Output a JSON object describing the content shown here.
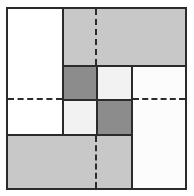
{
  "figure": {
    "title": "",
    "width": 194,
    "height": 196,
    "background": "#ffffff"
  },
  "palette": {
    "outline": "#2b2b2b",
    "white": "#ffffff",
    "off_white": "#f2f2f2",
    "near_white": "#fcfcfc",
    "light_gray": "#c8c8c8",
    "dark_gray": "#8c8c8c"
  },
  "frame": {
    "x": 6,
    "y": 7,
    "width": 181,
    "height": 183,
    "stroke": "#2b2b2b",
    "stroke_width": 2,
    "fill": "#ffffff"
  },
  "chart_data": {
    "type": "table",
    "xlabel": "",
    "ylabel": "",
    "grid": false,
    "legend": "none",
    "categories": [
      "top-left-white",
      "top-gray-band",
      "center-dark-top-left",
      "center-light-top-right",
      "center-light-bottom-left",
      "center-dark-bottom-right",
      "right-panel",
      "bottom-gray-band"
    ],
    "values": [
      "#ffffff",
      "#c8c8c8",
      "#8c8c8c",
      "#f2f2f2",
      "#f2f2f2",
      "#8c8c8c",
      "#fcfcfc",
      "#c8c8c8"
    ]
  },
  "blocks": [
    {
      "name": "top-left-white-block",
      "label": "top left white region",
      "x": 6,
      "y": 7,
      "width": 58,
      "height": 129,
      "fill": "#ffffff",
      "bordered": true
    },
    {
      "name": "top-gray-band",
      "label": "top light gray band",
      "x": 62,
      "y": 7,
      "width": 125,
      "height": 60,
      "fill": "#c8c8c8",
      "bordered": true
    },
    {
      "name": "center-cell-dark-top-left",
      "label": "center checkerboard dark cell, upper left",
      "x": 62,
      "y": 65,
      "width": 36,
      "height": 36,
      "fill": "#8c8c8c",
      "bordered": true
    },
    {
      "name": "center-cell-light-top-right",
      "label": "center checkerboard light cell, upper right",
      "x": 96,
      "y": 65,
      "width": 37,
      "height": 36,
      "fill": "#f2f2f2",
      "bordered": true
    },
    {
      "name": "center-cell-light-bottom-left",
      "label": "center checkerboard light cell, lower left",
      "x": 62,
      "y": 99,
      "width": 36,
      "height": 37,
      "fill": "#f2f2f2",
      "bordered": true
    },
    {
      "name": "center-cell-dark-bottom-right",
      "label": "center checkerboard dark cell, lower right",
      "x": 96,
      "y": 99,
      "width": 37,
      "height": 37,
      "fill": "#8c8c8c",
      "bordered": true
    },
    {
      "name": "right-panel-near-white",
      "label": "right near white panel",
      "x": 131,
      "y": 65,
      "width": 56,
      "height": 125,
      "fill": "#fcfcfc",
      "bordered": true
    },
    {
      "name": "bottom-gray-band",
      "label": "bottom light gray band",
      "x": 6,
      "y": 134,
      "width": 127,
      "height": 56,
      "fill": "#c8c8c8",
      "bordered": true
    }
  ],
  "dashed_lines": [
    {
      "name": "dashed-vertical-top",
      "label": "vertical dashed median through top gray band",
      "orientation": "vertical",
      "x": 95,
      "y": 9,
      "length": 56
    },
    {
      "name": "dashed-vertical-bottom",
      "label": "vertical dashed median through bottom gray band",
      "orientation": "vertical",
      "x": 95,
      "y": 136,
      "length": 52
    },
    {
      "name": "dashed-horizontal-left",
      "label": "horizontal dashed median across left white region",
      "orientation": "horizontal",
      "x": 8,
      "y": 98,
      "length": 54
    },
    {
      "name": "dashed-horizontal-right",
      "label": "horizontal dashed median across right panel",
      "orientation": "horizontal",
      "x": 133,
      "y": 98,
      "length": 52
    }
  ]
}
